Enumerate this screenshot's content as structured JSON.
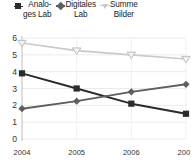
{
  "legend": {
    "position": "top",
    "entries": [
      {
        "label": "Analo-\nges Lab",
        "name": "Analoges Lab",
        "marker": "square-marker",
        "color": "#2b2b2b"
      },
      {
        "label": "Digitales\nLab",
        "name": "Digitales Lab",
        "marker": "diamond-marker",
        "color": "#5e5e5e"
      },
      {
        "label": "Summe\nBilder",
        "name": "Summe Bilder",
        "marker": "triangle-down-marker",
        "color": "#c9c9c9"
      }
    ]
  },
  "chart_data": {
    "type": "line",
    "title": "",
    "xlabel": "",
    "ylabel": "",
    "categories": [
      "2004",
      "2005",
      "2006",
      "2007"
    ],
    "ylim": [
      0,
      6
    ],
    "yticks": [
      "0",
      "1",
      "2",
      "3",
      "4",
      "5",
      "6"
    ],
    "grid": true,
    "legend_position": "top",
    "series": [
      {
        "name": "Analoges Lab",
        "color": "#2b2b2b",
        "marker": "square",
        "values": [
          3.9,
          3.0,
          2.1,
          1.5
        ]
      },
      {
        "name": "Digitales Lab",
        "color": "#5e5e5e",
        "marker": "diamond",
        "values": [
          1.8,
          2.25,
          2.8,
          3.25
        ]
      },
      {
        "name": "Summe Bilder",
        "color": "#c9c9c9",
        "marker": "triangle-down",
        "values": [
          5.7,
          5.25,
          5.0,
          4.75
        ]
      }
    ]
  }
}
